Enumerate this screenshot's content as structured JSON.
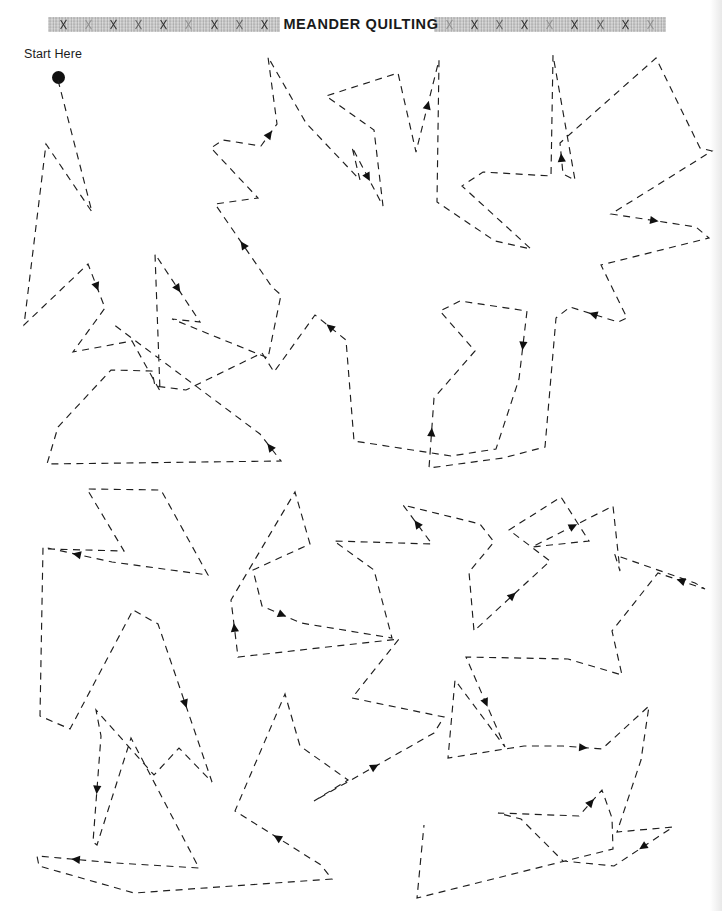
{
  "page": {
    "width": 722,
    "height": 911,
    "background_color": "#ffffff",
    "ink_color": "#1e1e1e"
  },
  "header": {
    "title": "MEANDER QUILTING",
    "band_color": "#b9b9b9",
    "band_motif": "cross-stitch-x",
    "band_left_x_count": 9,
    "band_right_x_count": 9
  },
  "start_marker": {
    "label": "Start Here",
    "dot_color": "#111111"
  },
  "stitch": {
    "dash_pattern": "7 5.5",
    "stroke_width": 1.15,
    "arrow_count": 30,
    "description": "Continuous angular meander quilting practice path"
  },
  "chart_data": {
    "type": "line",
    "title": "MEANDER QUILTING",
    "xlabel": "",
    "ylabel": "",
    "xlim": [
      0,
      722
    ],
    "ylim": [
      0,
      911
    ],
    "grid": false,
    "legend": null,
    "annotations": [
      {
        "text": "Start Here",
        "x": 24,
        "y": 47
      }
    ],
    "series": [
      {
        "name": "meander-path-1",
        "points": [
          [
            58,
            80
          ],
          [
            92,
            212
          ],
          [
            46,
            144
          ],
          [
            24,
            325
          ],
          [
            88,
            264
          ],
          [
            105,
            308
          ],
          [
            73,
            352
          ],
          [
            132,
            341
          ],
          [
            160,
            391
          ],
          [
            155,
            254
          ],
          [
            200,
            322
          ],
          [
            172,
            319
          ],
          [
            268,
            358
          ],
          [
            281,
            295
          ],
          [
            272,
            287
          ],
          [
            215,
            204
          ],
          [
            258,
            198
          ],
          [
            211,
            148
          ],
          [
            223,
            140
          ],
          [
            261,
            146
          ],
          [
            277,
            124
          ],
          [
            268,
            57
          ],
          [
            306,
            123
          ],
          [
            360,
            180
          ],
          [
            352,
            147
          ],
          [
            383,
            206
          ],
          [
            374,
            130
          ],
          [
            326,
            96
          ],
          [
            398,
            73
          ],
          [
            416,
            152
          ],
          [
            439,
            60
          ],
          [
            437,
            202
          ],
          [
            495,
            241
          ],
          [
            531,
            249
          ],
          [
            462,
            186
          ],
          [
            483,
            172
          ],
          [
            551,
            176
          ],
          [
            553,
            55
          ],
          [
            575,
            180
          ],
          [
            563,
            174
          ],
          [
            560,
            143
          ],
          [
            656,
            58
          ],
          [
            700,
            148
          ],
          [
            712,
            151
          ],
          [
            611,
            214
          ],
          [
            696,
            227
          ],
          [
            709,
            238
          ],
          [
            601,
            265
          ],
          [
            627,
            318
          ],
          [
            618,
            322
          ],
          [
            570,
            307
          ],
          [
            556,
            318
          ],
          [
            545,
            447
          ],
          [
            503,
            458
          ],
          [
            429,
            468
          ],
          [
            434,
            398
          ],
          [
            475,
            351
          ],
          [
            440,
            311
          ],
          [
            460,
            301
          ],
          [
            527,
            311
          ],
          [
            519,
            379
          ],
          [
            496,
            449
          ],
          [
            451,
            456
          ],
          [
            354,
            441
          ],
          [
            346,
            340
          ],
          [
            315,
            315
          ],
          [
            274,
            372
          ],
          [
            262,
            353
          ],
          [
            186,
            390
          ],
          [
            155,
            386
          ],
          [
            152,
            371
          ],
          [
            111,
            370
          ],
          [
            58,
            427
          ],
          [
            47,
            464
          ],
          [
            281,
            461
          ],
          [
            260,
            434
          ],
          [
            113,
            324
          ]
        ]
      },
      {
        "name": "meander-path-2",
        "points": [
          [
            48,
            549
          ],
          [
            124,
            551
          ],
          [
            87,
            489
          ],
          [
            161,
            490
          ],
          [
            208,
            575
          ],
          [
            112,
            562
          ],
          [
            43,
            547
          ],
          [
            40,
            716
          ],
          [
            70,
            729
          ],
          [
            133,
            610
          ],
          [
            158,
            624
          ],
          [
            212,
            782
          ],
          [
            179,
            748
          ],
          [
            154,
            775
          ],
          [
            96,
            710
          ],
          [
            101,
            736
          ],
          [
            93,
            842
          ],
          [
            97,
            845
          ],
          [
            131,
            738
          ],
          [
            199,
            868
          ],
          [
            116,
            863
          ],
          [
            37,
            856
          ],
          [
            39,
            866
          ],
          [
            134,
            893
          ],
          [
            332,
            879
          ],
          [
            321,
            865
          ],
          [
            235,
            811
          ],
          [
            285,
            694
          ],
          [
            300,
            746
          ],
          [
            348,
            780
          ],
          [
            314,
            801
          ],
          [
            434,
            733
          ],
          [
            444,
            717
          ],
          [
            352,
            698
          ],
          [
            399,
            639
          ],
          [
            238,
            657
          ],
          [
            231,
            600
          ],
          [
            295,
            492
          ],
          [
            310,
            544
          ],
          [
            253,
            570
          ],
          [
            262,
            606
          ],
          [
            301,
            623
          ],
          [
            392,
            638
          ],
          [
            374,
            570
          ],
          [
            334,
            541
          ],
          [
            432,
            544
          ],
          [
            403,
            505
          ],
          [
            480,
            524
          ],
          [
            494,
            542
          ],
          [
            469,
            572
          ],
          [
            474,
            631
          ],
          [
            550,
            561
          ],
          [
            509,
            530
          ],
          [
            561,
            497
          ],
          [
            589,
            541
          ],
          [
            532,
            547
          ],
          [
            613,
            506
          ],
          [
            620,
            571
          ],
          [
            615,
            555
          ],
          [
            695,
            583
          ],
          [
            705,
            589
          ],
          [
            658,
            573
          ],
          [
            612,
            631
          ],
          [
            622,
            675
          ],
          [
            568,
            659
          ],
          [
            466,
            657
          ],
          [
            505,
            747
          ],
          [
            455,
            680
          ],
          [
            448,
            758
          ],
          [
            524,
            746
          ],
          [
            563,
            746
          ],
          [
            602,
            749
          ],
          [
            649,
            706
          ],
          [
            641,
            760
          ],
          [
            617,
            832
          ],
          [
            673,
            827
          ],
          [
            614,
            866
          ],
          [
            563,
            861
          ],
          [
            521,
            819
          ],
          [
            498,
            813
          ],
          [
            579,
            816
          ],
          [
            602,
            790
          ],
          [
            612,
            818
          ],
          [
            613,
            849
          ],
          [
            417,
            898
          ],
          [
            424,
            825
          ]
        ]
      }
    ]
  }
}
